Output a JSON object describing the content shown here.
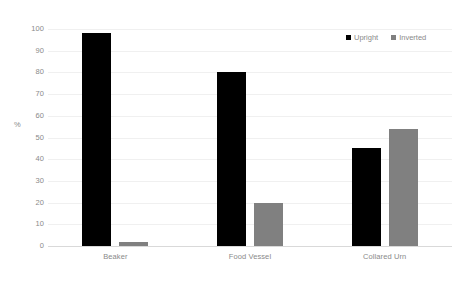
{
  "chart_data": {
    "type": "bar",
    "title": "",
    "xlabel": "",
    "ylabel": "%",
    "categories": [
      "Beaker",
      "Food Vessel",
      "Collared Urn"
    ],
    "series": [
      {
        "name": "Upright",
        "color": "#000000",
        "values": [
          98,
          80,
          45
        ]
      },
      {
        "name": "Inverted",
        "color": "#808080",
        "values": [
          2,
          20,
          54
        ]
      }
    ],
    "ylim": [
      0,
      100
    ],
    "yticks": [
      0,
      10,
      20,
      30,
      40,
      50,
      60,
      70,
      80,
      90,
      100
    ],
    "ytick_labels": [
      "0",
      "10",
      "20",
      "30",
      "40",
      "50",
      "60",
      "70",
      "80",
      "90",
      "100"
    ],
    "grid": true,
    "grid_axis": "y",
    "legend_position": "top-right",
    "background": "#ffffff",
    "gridline_color": "#f0f0f0",
    "axis_color": "#d9d9d9",
    "text_color": "#8a8a8a"
  }
}
